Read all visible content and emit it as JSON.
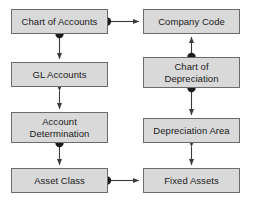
{
  "diagram": {
    "background_color": "#ffffff",
    "node_fill": "#d9d9d9",
    "node_border": "#6b6b6b",
    "edge_color": "#3b3b3b",
    "nodes": [
      {
        "id": "chart_of_accounts",
        "label": "Chart of Accounts",
        "x": 11,
        "y": 9,
        "w": 97,
        "h": 25
      },
      {
        "id": "company_code",
        "label": "Company Code",
        "x": 143,
        "y": 9,
        "w": 97,
        "h": 25
      },
      {
        "id": "gl_accounts",
        "label": "GL Accounts",
        "x": 11,
        "y": 62,
        "w": 97,
        "h": 25
      },
      {
        "id": "chart_of_depreciation",
        "label": "Chart of\nDepreciation",
        "x": 143,
        "y": 57,
        "w": 97,
        "h": 31
      },
      {
        "id": "account_determination",
        "label": "Account\nDetermination",
        "x": 11,
        "y": 112,
        "w": 97,
        "h": 31
      },
      {
        "id": "depreciation_area",
        "label": "Depreciation Area",
        "x": 143,
        "y": 118,
        "w": 97,
        "h": 25
      },
      {
        "id": "asset_class",
        "label": "Asset Class",
        "x": 11,
        "y": 168,
        "w": 97,
        "h": 25
      },
      {
        "id": "fixed_assets",
        "label": "Fixed Assets",
        "x": 143,
        "y": 168,
        "w": 97,
        "h": 25
      }
    ],
    "edges": [
      {
        "id": "edge-chart-of-accounts-to-company-code",
        "from": "chart_of_accounts",
        "to": "company_code",
        "style": "dot-to-arrow",
        "orientation": "horizontal"
      },
      {
        "id": "edge-chart-of-accounts-to-gl-accounts",
        "from": "chart_of_accounts",
        "to": "gl_accounts",
        "style": "dot-to-arrow",
        "orientation": "vertical"
      },
      {
        "id": "edge-gl-accounts-to-account-determination",
        "from": "gl_accounts",
        "to": "account_determination",
        "style": "double-arrow",
        "orientation": "vertical"
      },
      {
        "id": "edge-account-determination-to-asset-class",
        "from": "account_determination",
        "to": "asset_class",
        "style": "dot-to-arrow",
        "orientation": "vertical"
      },
      {
        "id": "edge-asset-class-to-fixed-assets",
        "from": "asset_class",
        "to": "fixed_assets",
        "style": "dot-to-arrow",
        "orientation": "horizontal"
      },
      {
        "id": "edge-chart-of-depreciation-to-company-code",
        "from": "chart_of_depreciation",
        "to": "company_code",
        "style": "dot-to-arrow",
        "orientation": "vertical-up"
      },
      {
        "id": "edge-chart-of-depreciation-to-depreciation-area",
        "from": "chart_of_depreciation",
        "to": "depreciation_area",
        "style": "dot-to-arrow",
        "orientation": "vertical"
      },
      {
        "id": "edge-depreciation-area-to-fixed-assets",
        "from": "depreciation_area",
        "to": "fixed_assets",
        "style": "double-arrow",
        "orientation": "vertical"
      }
    ]
  }
}
